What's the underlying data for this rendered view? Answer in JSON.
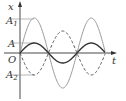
{
  "diagram": {
    "type": "wave superposition (x-t graph)",
    "axes": {
      "x_axis_label": "t",
      "y_axis_label": "x",
      "origin_label": "O"
    },
    "levels": [
      {
        "label": "A",
        "sub": "1",
        "value": "A1",
        "y": 20
      },
      {
        "label": "A",
        "sub": "",
        "value": "A",
        "y": 43
      },
      {
        "label": "A",
        "sub": "2",
        "value": "A2",
        "y": 75
      }
    ],
    "curves": [
      {
        "name": "large-wave",
        "style": "solid light gray",
        "color": "#9a9a9a",
        "amplitude_px": 35,
        "phase": "sin"
      },
      {
        "name": "small-wave",
        "style": "solid dark",
        "color": "#333333",
        "amplitude_px": 10,
        "phase": "sin"
      },
      {
        "name": "dashed-wave",
        "style": "dashed",
        "color": "#555555",
        "amplitude_px": 22,
        "phase": "-sin"
      }
    ],
    "geometry": {
      "origin_x": 20,
      "origin_y": 53,
      "period_px": 57,
      "x_end": 105
    }
  }
}
